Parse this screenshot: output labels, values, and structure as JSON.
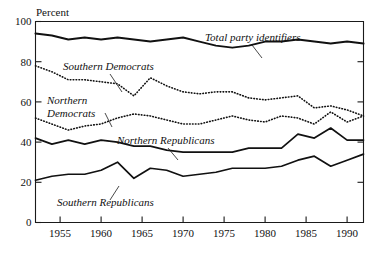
{
  "chart_data": {
    "type": "line",
    "title": "",
    "xlabel": "",
    "ylabel": "Percent",
    "xlim": [
      1952,
      1992
    ],
    "ylim": [
      0,
      100
    ],
    "grid": false,
    "legend_position": "inline-annotations",
    "y_ticks": [
      0,
      20,
      40,
      60,
      80,
      100
    ],
    "y_tick_labels": [
      "0",
      "20",
      "40",
      "60",
      "80",
      "100"
    ],
    "x_ticks": [
      1955,
      1960,
      1965,
      1970,
      1975,
      1980,
      1985,
      1990
    ],
    "x_tick_labels": [
      "1955",
      "1960",
      "1965",
      "1970",
      "1975",
      "1980",
      "1985",
      "1990"
    ],
    "x": [
      1952,
      1954,
      1956,
      1958,
      1960,
      1962,
      1964,
      1966,
      1968,
      1970,
      1972,
      1974,
      1976,
      1978,
      1980,
      1982,
      1984,
      1986,
      1988,
      1990,
      1992
    ],
    "series": [
      {
        "name": "Total party identifiers",
        "style": "solid-thick",
        "values": [
          94,
          93,
          91,
          92,
          91,
          92,
          91,
          90,
          91,
          92,
          90,
          88,
          87,
          88,
          90,
          90,
          91,
          90,
          89,
          90,
          89
        ]
      },
      {
        "name": "Southern Democrats",
        "style": "dotted",
        "values": [
          78,
          75,
          71,
          71,
          70,
          69,
          63,
          72,
          68,
          65,
          64,
          65,
          65,
          62,
          61,
          62,
          63,
          57,
          58,
          56,
          53
        ]
      },
      {
        "name": "Northern Democrats",
        "style": "dotted",
        "values": [
          52,
          49,
          46,
          48,
          49,
          52,
          54,
          53,
          51,
          49,
          49,
          51,
          53,
          51,
          50,
          53,
          52,
          49,
          55,
          50,
          53
        ]
      },
      {
        "name": "Northern Republicans",
        "style": "solid",
        "values": [
          42,
          39,
          41,
          39,
          41,
          40,
          38,
          38,
          36,
          35,
          35,
          35,
          35,
          37,
          37,
          37,
          44,
          42,
          47,
          41,
          41
        ]
      },
      {
        "name": "Southern Republicans",
        "style": "solid",
        "values": [
          21,
          23,
          24,
          24,
          26,
          30,
          22,
          27,
          26,
          23,
          24,
          25,
          27,
          27,
          27,
          28,
          31,
          33,
          28,
          31,
          34
        ]
      }
    ],
    "annotations": [
      {
        "text": "Total party identifiers",
        "series": "Total party identifiers",
        "label_x": 205,
        "label_y": 41,
        "leader": [
          [
            252,
            45
          ],
          [
            262,
            58
          ]
        ]
      },
      {
        "text": "Southern Democrats",
        "series": "Southern Democrats",
        "label_x": 63,
        "label_y": 70,
        "leader": [
          [
            110,
            74
          ],
          [
            122,
            92
          ]
        ]
      },
      {
        "text": "Northern",
        "series": "Northern Democrats",
        "label_x": 47,
        "label_y": 104,
        "leader": []
      },
      {
        "text": "Democrats",
        "series": "Northern Democrats",
        "label_x": 47,
        "label_y": 117,
        "leader": [
          [
            105,
            113
          ],
          [
            112,
            127
          ]
        ]
      },
      {
        "text": "Northern Republicans",
        "series": "Northern Republicans",
        "label_x": 117,
        "label_y": 144,
        "leader": [
          [
            168,
            148
          ],
          [
            178,
            160
          ]
        ]
      },
      {
        "text": "Southern Republicans",
        "series": "Southern Republicans",
        "label_x": 57,
        "label_y": 206,
        "leader": [
          [
            110,
            200
          ],
          [
            119,
            186
          ]
        ]
      }
    ]
  }
}
